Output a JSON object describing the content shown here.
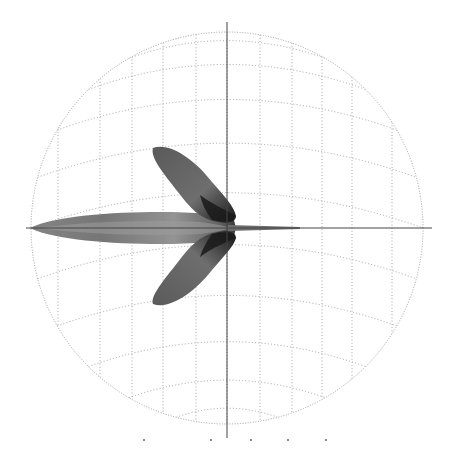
{
  "figure": {
    "type": "3d-sphere-wireframe-with-lobes",
    "background": "#ffffff",
    "sphere": {
      "center": [
        227,
        228
      ],
      "radius": 196,
      "grid_color": "#9a9a9a",
      "meridians_x": [
        58,
        100,
        132,
        163,
        196,
        227,
        260,
        292,
        322,
        352,
        392
      ],
      "parallels_count": 11
    },
    "axes": {
      "color": "#444444",
      "vertical": {
        "x": 227,
        "y1": 22,
        "y2": 438
      },
      "horizontal": {
        "y": 228,
        "x1": 26,
        "x2": 432
      }
    },
    "shapes": {
      "main_lobe_color": "#5a5a5a",
      "main_lobe_light": "#9a9a9a",
      "wing_color": "#4a4a4a",
      "wing_dark": "#1e1e1e"
    },
    "bottom_marks_x": [
      143,
      210,
      250,
      287,
      325
    ]
  }
}
